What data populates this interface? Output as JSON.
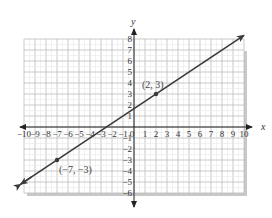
{
  "chart_data": {
    "type": "line",
    "title": "",
    "xlabel": "x",
    "ylabel": "y",
    "xlim": [
      -10,
      10
    ],
    "ylim": [
      -6,
      8
    ],
    "grid": true,
    "x_ticks": [
      -10,
      -9,
      -8,
      -7,
      -6,
      -5,
      -4,
      -3,
      -2,
      -1,
      0,
      1,
      2,
      3,
      4,
      5,
      6,
      7,
      8,
      9,
      10
    ],
    "y_ticks": [
      -6,
      -5,
      -4,
      -3,
      -2,
      -1,
      1,
      2,
      3,
      4,
      5,
      6,
      7,
      8
    ],
    "series": [
      {
        "name": "line through (-7,-3) and (2,3)",
        "x": [
          -10,
          10
        ],
        "y": [
          -5,
          8.333
        ],
        "slope": 0.6667,
        "intercept": 1.6667,
        "arrows": "both"
      }
    ],
    "points": [
      {
        "x": 2,
        "y": 3,
        "label": "(2, 3)"
      },
      {
        "x": -7,
        "y": -3,
        "label": "(−7, −3)"
      }
    ]
  },
  "colors": {
    "grid": "#bdbdbd",
    "axis": "#222222",
    "line": "#3a3a3a",
    "shadow": "#c8c8c8"
  }
}
